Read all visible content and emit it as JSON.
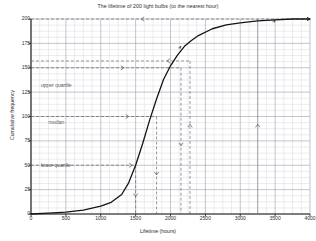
{
  "chart_data": {
    "type": "line",
    "title": "The lifetime of 200 light bulbs (to the nearest hour)",
    "xlabel": "Lifetime (hours)",
    "ylabel": "Cumulative frequency",
    "xlim": [
      0,
      4000
    ],
    "ylim": [
      0,
      200
    ],
    "xticks": [
      0,
      500,
      1000,
      1500,
      2000,
      2500,
      3000,
      3500,
      4000
    ],
    "yticks": [
      0,
      25,
      50,
      75,
      100,
      125,
      150,
      175,
      200
    ],
    "grid": true,
    "legend": "none",
    "series": [
      {
        "name": "Cumulative frequency",
        "x": [
          0,
          250,
          500,
          750,
          1000,
          1150,
          1300,
          1400,
          1500,
          1600,
          1700,
          1800,
          1900,
          2000,
          2100,
          2200,
          2300,
          2400,
          2600,
          2800,
          3000,
          3250,
          3500,
          3750,
          4000
        ],
        "values": [
          0,
          1,
          2,
          4,
          8,
          12,
          20,
          32,
          50,
          72,
          96,
          118,
          138,
          152,
          163,
          172,
          178,
          183,
          190,
          194,
          196,
          198,
          199,
          200,
          200
        ]
      }
    ],
    "annotations": [
      {
        "label": "upper quartile",
        "value": 150,
        "marker_x": 2150
      },
      {
        "label": "median",
        "value": 100,
        "marker_x": 1800
      },
      {
        "label": "lower quartile",
        "value": 50,
        "marker_x": 1500
      },
      {
        "label": "",
        "value": 200,
        "marker_x": 3250
      },
      {
        "label": "",
        "value": 157,
        "marker_x": 2280
      }
    ],
    "guide_lines_y": [
      200,
      157,
      150,
      100,
      50
    ],
    "guide_lines_x": [
      1500,
      1800,
      2150,
      2280,
      3250
    ]
  },
  "annotation_labels": {
    "upper_quartile": "upper quartile",
    "median": "median",
    "lower_quartile": "lower quartile"
  }
}
